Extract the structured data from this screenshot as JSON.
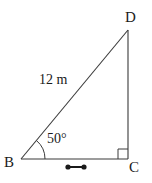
{
  "figure": {
    "type": "right-triangle-diagram",
    "stroke_color": "#3a3a3a",
    "text_color": "#1a1a1a",
    "background_color": "#ffffff",
    "vertices": [
      {
        "name": "B",
        "label": "B",
        "x": 21,
        "y": 159,
        "position": "bottom-left"
      },
      {
        "name": "C",
        "label": "C",
        "x": 128,
        "y": 159,
        "position": "bottom-right"
      },
      {
        "name": "D",
        "label": "D",
        "x": 128,
        "y": 30,
        "position": "top-right"
      }
    ],
    "sides": [
      {
        "name": "BD",
        "from": "B",
        "to": "D",
        "role": "hypotenuse",
        "label": "12 m",
        "label_x": 39,
        "label_y": 73
      },
      {
        "name": "BC",
        "from": "B",
        "to": "C",
        "role": "adjacent-leg",
        "label": "",
        "marked": true
      },
      {
        "name": "DC",
        "from": "D",
        "to": "C",
        "role": "opposite-leg",
        "label": ""
      }
    ],
    "angles": [
      {
        "at": "B",
        "label": "50°",
        "value": 50,
        "unit": "degrees",
        "marker": "arc",
        "label_x": 47,
        "label_y": 132
      },
      {
        "at": "C",
        "label": "",
        "value": 90,
        "unit": "degrees",
        "marker": "right-angle-square"
      }
    ],
    "markers": [
      {
        "name": "segment-length-marker",
        "on_side": "BC",
        "style": "dumbbell",
        "x1": 68,
        "x2": 84,
        "y": 167,
        "dot_radius": 2.6
      }
    ]
  }
}
